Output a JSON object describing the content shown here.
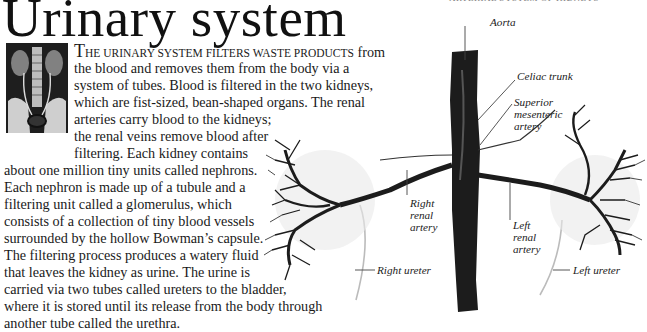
{
  "page": {
    "title": "Urinary system",
    "intro_first_word_cap": "T",
    "intro_smallcaps": "HE URINARY SYSTEM FILTERS WASTE PRODUCTS",
    "intro_rest_line1": " from",
    "body_lines": [
      "the blood and removes them from the body via a",
      "system of tubes. Blood is filtered in the two kidneys,",
      "which are fist-sized, bean-shaped organs. The renal",
      "arteries carry blood to the kidneys;",
      "the renal veins remove blood after",
      "filtering. Each kidney contains",
      "about one million tiny units called nephrons.",
      "Each nephron is made up of a tubule and a",
      "filtering unit called a glomerulus, which",
      "consists of a collection of tiny blood vessels",
      "surrounded by the hollow Bowman’s capsule.",
      "The filtering process produces a watery fluid",
      "that leaves the kidney as urine. The urine is",
      "carried via two tubes called ureters to the bladder,",
      "where it is stored until its release from the body through",
      "another tube called the urethra."
    ],
    "thumbnail": "x-ray-of-urinary-system"
  },
  "diagram": {
    "heading": "ARTERIAL SYSTEM OF KIDNEYS",
    "labels": {
      "aorta": "Aorta",
      "celiac_trunk": "Celiac trunk",
      "superior_mesenteric_1": "Superior",
      "superior_mesenteric_2": "mesenteric",
      "superior_mesenteric_3": "artery",
      "right_renal_1": "Right",
      "right_renal_2": "renal",
      "right_renal_3": "artery",
      "left_renal_1": "Left",
      "left_renal_2": "renal",
      "left_renal_3": "artery",
      "right_ureter": "Right ureter",
      "left_ureter": "Left ureter"
    }
  }
}
